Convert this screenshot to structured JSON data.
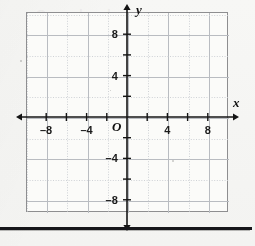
{
  "figure": {
    "kind": "coordinate-plane",
    "x_axis_label": "x",
    "y_axis_label": "y",
    "origin_label": "O"
  },
  "chart_data": {
    "type": "scatter",
    "title": "",
    "subtitle": "",
    "xlabel": "x",
    "ylabel": "y",
    "origin_label": "O",
    "xlim": [
      -10,
      10
    ],
    "ylim": [
      -10,
      10
    ],
    "x_tick_interval": 2,
    "y_tick_interval": 2,
    "x_ticks": [
      -8,
      -6,
      -4,
      -2,
      2,
      4,
      6,
      8
    ],
    "y_ticks": [
      -8,
      -6,
      -4,
      -2,
      2,
      4,
      6,
      8
    ],
    "x_tick_labels": [
      "–8",
      "–4",
      "4",
      "8"
    ],
    "x_labeled_ticks": [
      -8,
      -4,
      4,
      8
    ],
    "y_tick_labels": [
      "8",
      "4",
      "–4",
      "–8"
    ],
    "y_labeled_ticks": [
      8,
      4,
      -4,
      -8
    ],
    "grid": true,
    "grid_minor_interval": 2,
    "grid_major_interval": 4,
    "legend": "none",
    "series": [],
    "values": [],
    "annotations": [],
    "axis_arrows": [
      "left",
      "right",
      "up",
      "down"
    ]
  },
  "colors": {
    "page_background": "#f6f6f4",
    "plot_background": "#fbfbf9",
    "plot_border": "#8e8e90",
    "axis": "#141414",
    "grid_minor": "#cfd2d6",
    "grid_major": "#b9bcc1",
    "label_text": "#1b1b1b",
    "rule": "#16161a"
  },
  "ghost_text": {
    "line1": "Sample ghost",
    "line2": "bleed text",
    "line3": "scan artifact",
    "line4": "faint"
  }
}
